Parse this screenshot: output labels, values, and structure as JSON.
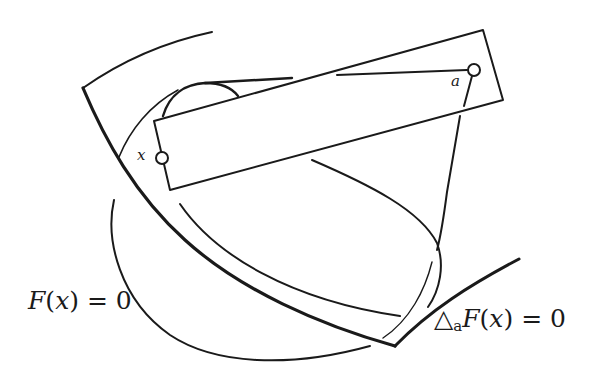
{
  "figure": {
    "type": "geometric diagram",
    "labels": {
      "point_x": "x",
      "point_a": "a",
      "surface_left": {
        "func": "F",
        "open": "(",
        "var": "x",
        "close": ")",
        "rhs": " = 0"
      },
      "surface_right": {
        "delta": "△",
        "sub": "a",
        "func": "F",
        "open": "(",
        "var": "x",
        "close": ")",
        "rhs": " = 0"
      }
    },
    "colors": {
      "stroke": "#1a1a1a",
      "background": "#ffffff"
    }
  }
}
